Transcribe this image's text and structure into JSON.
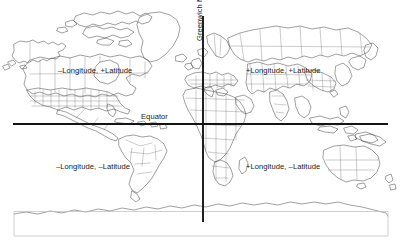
{
  "figure": {
    "type": "world-map-coordinate-quadrants"
  },
  "reference_lines": {
    "horizontal": {
      "name": "Equator",
      "label": "Equator",
      "color": "#141414"
    },
    "vertical": {
      "name": "Greenwich Meridian",
      "label": "Greenwich Meridian",
      "color": "#141414"
    }
  },
  "quadrant_labels": {
    "northwest": "–Longitude, +Latitude",
    "northeast": "+Longitude, +Latitude",
    "southwest": "–Longitude, –Latitude",
    "southeast": "+Longitude, –Latitude"
  },
  "colors": {
    "background": "#ffffff",
    "coastline": "#2b2b2b",
    "country_borders": "#6a6a6a",
    "axis_lines": "#141414",
    "antarctic_box": "#bdbdbd",
    "text": "#1b1b1b"
  }
}
